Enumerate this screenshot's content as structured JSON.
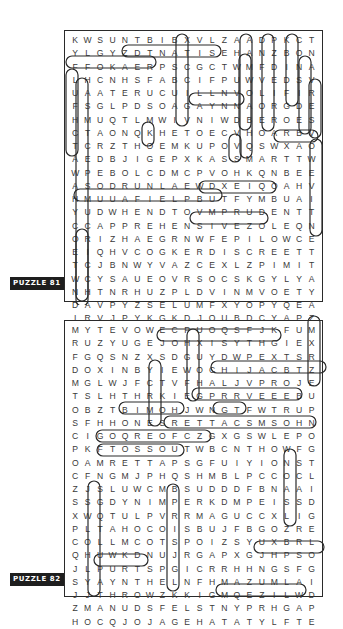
{
  "puzzles": [
    {
      "label": "PUZZLE 81",
      "rows": [
        "KWSUNTBIBXVLZAADPKCTLIS",
        "YLGYZDTNATISEHANZBONUSE",
        "FFOKAERPSCGCTWMFDINANMM",
        "LHCNHSFABCIFPUWVEDSVNIM",
        "UAATERUCUILLNVOLIFIRANA",
        "FSGLPDSOAGAYNNAORGDEYDL",
        "HMUQTLMWIVNIWDBEROESEFE",
        "CTAONQKHETOECVHOARBVUR",
        "TCRZTHOEMKUPOVQSWXAOTIT",
        "AEDBJIGEPXKASSMARTTWARY",
        "WPEBOLCDMCPVOHKQNBEEOJT",
        "ASODRUNLAEWDXEIQOAHVVUH",
        "HMUUAFIELPBUTFYMBUAINDO",
        "YUDWHENDTOVMPRUDENTTHIU",
        "CCAPPREHENSIVEZOLEQNGCG",
        "ORIZHAEGRNWFEPILOWCEIIH",
        "EIQHVCOGKERDISCREETTQOT",
        "TCJBNWYVAZCEXLZPIMITZUF",
        "WCYSAUEOVRSOCSKGYLYABSU",
        "NHTNRHUZPLDVINMVOETYWCL",
        "DAVPYZSELUMFXYOPYQEALEJ",
        "IRVJPYKGKDJQUBDCYAPZVAH",
        "FYAMUMFJQKPVBLHZRYPXHHN"
      ]
    },
    {
      "label": "PUZZLE 82",
      "rows": [
        "MYTEVOWECPUOQSFJKFUMXPL",
        "RUZYUGEJOHXISYTHGIEXZPR",
        "FGQSNZXSDGUYDWPEXTSRNU",
        "DOXINBYIEWOCHIJACBTZGHH",
        "MGLWJFCTVFHALJVPROJECT",
        "TSLHTHRKIEGPRRVEEEBUXJX",
        "OBZTBIMOHJWNGTFWTRUPSXV",
        "SFHHONESRETTACSMSOHNSGX",
        "CIGOQREOFCZGXGSWLEPORP",
        "PKFTOSSOUTWBCNTHOWFGIYV",
        "OAMRETTAPSGFUIYIONSTKWA",
        "CFNGMJPHQSHMBLPCCOCLPVC",
        "ZJSLUWCMBSUDDDFBNAAITXRCV",
        "SSGDYNIMPERKDMPEISSDDJ",
        "XWQTULPVRRMAGUCCXLIGAMV",
        "PLTAHOCOISBUJFBGOZREMOB",
        "COLLMCOTSPOIZSYUXBRLSWI",
        "QHUWKDNUJRGAPXGJHPSOSXV",
        "JLPURTSPGICRRHHNGSFGAAH",
        "SYAYNTHELNFHMAZUMLAIERK",
        "JJTHROWZKKIGMQEZILWDNKH",
        "ZMANUDSFELSTNYPRHGAPIQV",
        "HOCQJOJAGEHATATYLFTEDKH"
      ]
    }
  ],
  "grid81": [
    "KWSUNTBIBXVLZAADPKCTLIS",
    "YLGYZDTNATISEHANZBONUSE"
  ],
  "found_words": {
    "puzzle_81": [
      "NATISEH",
      "FFOKAERP",
      "YNNAO",
      "PRUDENT",
      "DISCREET",
      "WARY",
      "APPREHENSIVE",
      "CHARY",
      "CONSIDERED",
      "TENTATIVE",
      "LINNY",
      "MINDFUL",
      "ALERT",
      "VIGILANT",
      "JUDICIOUS",
      "CAUTIOUS"
    ],
    "puzzle_82": [
      "XISYTHGIE",
      "PROJECT",
      "TRUPS",
      "SENO",
      "RETTACS",
      "WELEPORP",
      "FTOSSOUT",
      "RETTAPS",
      "THROW",
      "LAIERK",
      "TYLFTED",
      "LRUH",
      "SPRINKLE",
      "TACUAHC"
    ]
  }
}
